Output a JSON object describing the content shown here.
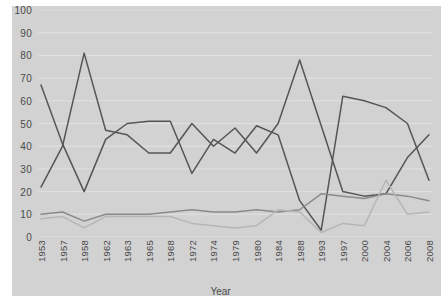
{
  "chart_data": {
    "type": "line",
    "title": "",
    "xlabel": "Year",
    "ylabel": "",
    "ylim": [
      0,
      100
    ],
    "ytick_step": 10,
    "yticks": [
      0,
      10,
      20,
      30,
      40,
      50,
      60,
      70,
      80,
      90,
      100
    ],
    "grid": true,
    "legend": "none",
    "categories": [
      "1953",
      "1957",
      "1958",
      "1962",
      "1963",
      "1965",
      "1968",
      "1972",
      "1974",
      "1979",
      "1980",
      "1984",
      "1988",
      "1993",
      "1997",
      "2000",
      "2004",
      "2006",
      "2008"
    ],
    "series": [
      {
        "name": "series-1",
        "color": "#555555",
        "values": [
          67,
          41,
          20,
          43,
          50,
          51,
          51,
          28,
          43,
          37,
          49,
          45,
          16,
          3,
          62,
          60,
          57,
          50,
          25
        ]
      },
      {
        "name": "series-2",
        "color": "#555555",
        "values": [
          22,
          40,
          81,
          47,
          45,
          37,
          37,
          50,
          40,
          48,
          37,
          50,
          78,
          49,
          20,
          18,
          19,
          35,
          45
        ]
      },
      {
        "name": "series-3",
        "color": "#8a8a8a",
        "values": [
          10,
          11,
          7,
          10,
          10,
          10,
          11,
          12,
          11,
          11,
          12,
          11,
          12,
          19,
          18,
          17,
          19,
          18,
          16
        ]
      },
      {
        "name": "series-4",
        "color": "#b6b6b6",
        "values": [
          8,
          9,
          4,
          9,
          9,
          9,
          9,
          6,
          5,
          4,
          5,
          12,
          11,
          2,
          6,
          5,
          25,
          10,
          11
        ]
      }
    ]
  },
  "axis": {
    "x_title": "Year"
  },
  "colors": {
    "plot_background": "#d2d2d2",
    "page_background": "#ffffff",
    "gridline": "#e2e2e2",
    "tick_label": "#4a4a4a",
    "series_dark": "#555555",
    "series_mid": "#8a8a8a",
    "series_light": "#b6b6b6"
  }
}
